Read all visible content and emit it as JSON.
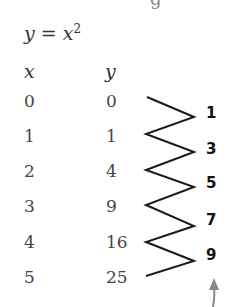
{
  "cut_text": "g",
  "equation": {
    "lhs": "y",
    "eq": "=",
    "base": "x",
    "exp": "2"
  },
  "table": {
    "headers": {
      "x": "x",
      "y": "y"
    },
    "rows": [
      {
        "x": "0",
        "y": "0"
      },
      {
        "x": "1",
        "y": "1"
      },
      {
        "x": "2",
        "y": "4"
      },
      {
        "x": "3",
        "y": "9"
      },
      {
        "x": "4",
        "y": "16"
      },
      {
        "x": "5",
        "y": "25"
      }
    ]
  },
  "differences": [
    "1",
    "3",
    "5",
    "7",
    "9"
  ],
  "colors": {
    "zigzag": "#1a1a1a",
    "arrow": "#888888"
  }
}
